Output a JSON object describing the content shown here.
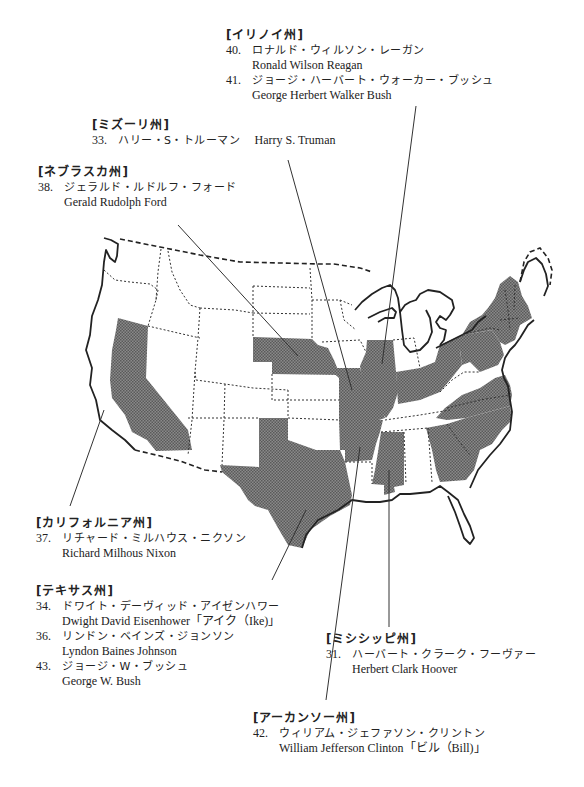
{
  "map": {
    "title_region": "US presidents by birth state",
    "highlight_color": "#7a7a7a",
    "highlighted_states": [
      "California",
      "Nebraska",
      "Missouri",
      "Illinois",
      "Texas",
      "Arkansas",
      "Mississippi",
      "Georgia",
      "South Carolina",
      "North Carolina",
      "Virginia",
      "Ohio",
      "Kentucky",
      "Pennsylvania",
      "New York",
      "Vermont",
      "New Hampshire",
      "Massachusetts",
      "Connecticut",
      "New Jersey",
      "Louisiana"
    ]
  },
  "illinois": {
    "state": "[イリノイ州]",
    "entries": [
      {
        "num": "40.",
        "jp": "ロナルド・ウィルソン・レーガン",
        "en": "Ronald Wilson Reagan"
      },
      {
        "num": "41.",
        "jp": "ジョージ・ハーバート・ウォーカー・ブッシュ",
        "en": "George Herbert Walker Bush"
      }
    ]
  },
  "missouri": {
    "state": "[ミズーリ州]",
    "entries": [
      {
        "num": "33.",
        "jp": "ハリー・S・トルーマン",
        "en": "Harry S. Truman"
      }
    ]
  },
  "nebraska": {
    "state": "[ネブラスカ州]",
    "entries": [
      {
        "num": "38.",
        "jp": "ジェラルド・ルドルフ・フォード",
        "en": "Gerald Rudolph Ford"
      }
    ]
  },
  "california": {
    "state": "[カリフォルニア州]",
    "entries": [
      {
        "num": "37.",
        "jp": "リチャード・ミルハウス・ニクソン",
        "en": "Richard Milhous Nixon"
      }
    ]
  },
  "texas": {
    "state": "[テキサス州]",
    "entries": [
      {
        "num": "34.",
        "jp": "ドワイト・デーヴィッド・アイゼンハワー",
        "en": "Dwight David Eisenhower「アイク（Ike)」"
      },
      {
        "num": "36.",
        "jp": "リンドン・ベインズ・ジョンソン",
        "en": "Lyndon Baines Johnson"
      },
      {
        "num": "43.",
        "jp": "ジョージ・W・ブッシュ",
        "en": "George W. Bush"
      }
    ]
  },
  "mississippi": {
    "state": "[ミシシッピ州]",
    "entries": [
      {
        "num": "31.",
        "jp": "ハーバート・クラーク・フーヴァー",
        "en": "Herbert Clark Hoover"
      }
    ]
  },
  "arkansas": {
    "state": "[アーカンソー州]",
    "entries": [
      {
        "num": "42.",
        "jp": "ウィリアム・ジェファソン・クリントン",
        "en": "William Jefferson Clinton「ビル（Bill)」"
      }
    ]
  }
}
